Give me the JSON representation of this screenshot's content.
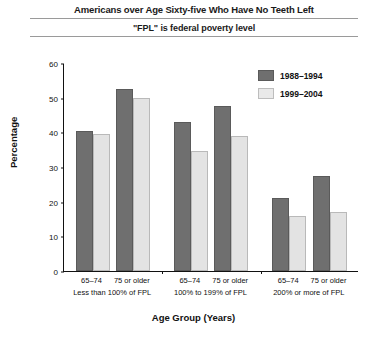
{
  "chart_data": {
    "type": "bar",
    "title": "Americans over Age Sixty-five Who Have No Teeth Left",
    "subtitle": "\"FPL\" is federal poverty level",
    "xlabel": "Age Group (Years)",
    "ylabel": "Percentage",
    "ylim": [
      0,
      60
    ],
    "yticks": [
      0,
      10,
      20,
      30,
      40,
      50,
      60
    ],
    "grid": false,
    "legend_position": "top-right",
    "categories": [
      "65–74",
      "75 or older",
      "65–74",
      "75 or older",
      "65–74",
      "75 or older"
    ],
    "groups": [
      {
        "label": "Less than 100% of FPL",
        "categories": [
          "65–74",
          "75 or older"
        ]
      },
      {
        "label": "100% to 199% of FPL",
        "categories": [
          "65–74",
          "75 or older"
        ]
      },
      {
        "label": "200% or more of FPL",
        "categories": [
          "65–74",
          "75 or older"
        ]
      }
    ],
    "series": [
      {
        "name": "1988–1994",
        "color": "#6f6f6f",
        "values": [
          40.5,
          52.5,
          43.0,
          47.5,
          21.0,
          27.5
        ]
      },
      {
        "name": "1999–2004",
        "color": "#e3e3e3",
        "values": [
          39.5,
          50.0,
          34.5,
          39.0,
          16.0,
          17.0
        ]
      }
    ]
  },
  "legend": [
    {
      "label": "1988–1994"
    },
    {
      "label": "1999–2004"
    }
  ]
}
